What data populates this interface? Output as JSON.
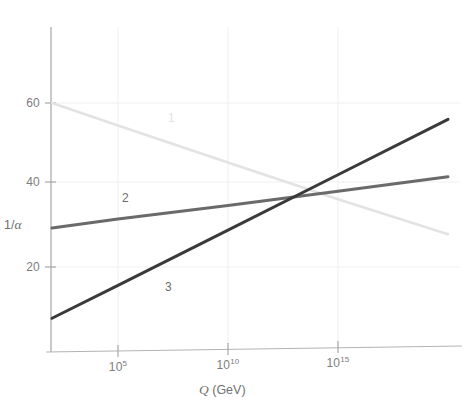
{
  "figure": {
    "width": 466,
    "height": 408,
    "background": "#ffffff"
  },
  "axes": {
    "x_title_var": "Q",
    "x_title_unit": " (GeV)",
    "y_title_num": "1/",
    "y_title_alpha": "α",
    "x_ticks": [
      {
        "label_base": "10",
        "label_exp": "5",
        "value": 5,
        "x_px": 118
      },
      {
        "label_base": "10",
        "label_exp": "10",
        "value": 10,
        "x_px": 228
      },
      {
        "label_base": "10",
        "label_exp": "15",
        "value": 15,
        "x_px": 338
      }
    ],
    "y_ticks": [
      {
        "label": "60",
        "value": 60,
        "y_px": 103
      },
      {
        "label": "40",
        "value": 40,
        "y_px": 182
      },
      {
        "label": "20",
        "value": 20,
        "y_px": 267
      }
    ],
    "axis_color": "#b9b9b9",
    "grid_color": "#ededed",
    "tick_text_color": "#7d7d7d"
  },
  "curve_labels": [
    {
      "text": "1",
      "x_px": 168,
      "y_px": 111,
      "faint": true
    },
    {
      "text": "2",
      "x_px": 122,
      "y_px": 191,
      "faint": false
    },
    {
      "text": "3",
      "x_px": 165,
      "y_px": 280,
      "faint": false
    }
  ],
  "chart_data": {
    "type": "line",
    "title": "",
    "subtitle": "",
    "xlabel": "Q (GeV)",
    "ylabel": "1/α",
    "xscale": "log10",
    "xlim": [
      2,
      20
    ],
    "ylim": [
      0,
      78
    ],
    "xtick_labels": [
      "10^5",
      "10^10",
      "10^15"
    ],
    "ytick_labels": [
      "20",
      "40",
      "60"
    ],
    "grid": true,
    "legend": "inline-annotations",
    "annotations": [
      "1",
      "2",
      "3"
    ],
    "series": [
      {
        "name": "1",
        "label": "1",
        "color": "#e3e3e3",
        "width": 2.6,
        "x": [
          2,
          5,
          10,
          15,
          20
        ],
        "y": [
          60.0,
          54.5,
          45.5,
          36.5,
          28.0
        ],
        "comment": "U(1) hypercharge coupling: 1/alpha decreases with energy"
      },
      {
        "name": "2",
        "label": "2",
        "color": "#6a6a6a",
        "width": 3.0,
        "x": [
          2,
          5,
          10,
          15,
          20
        ],
        "y": [
          29.5,
          31.7,
          35.0,
          38.5,
          42.0
        ],
        "comment": "SU(2) weak coupling: 1/alpha rises slowly with energy"
      },
      {
        "name": "3",
        "label": "3",
        "color": "#3a3a3a",
        "width": 3.0,
        "x": [
          2,
          5,
          10,
          15,
          20
        ],
        "y": [
          7.5,
          15.5,
          29.0,
          42.5,
          56.0
        ],
        "comment": "SU(3) strong coupling: 1/alpha rises steeply with energy"
      }
    ],
    "crossing_region": {
      "x": 17.0,
      "y": 37.5
    }
  }
}
